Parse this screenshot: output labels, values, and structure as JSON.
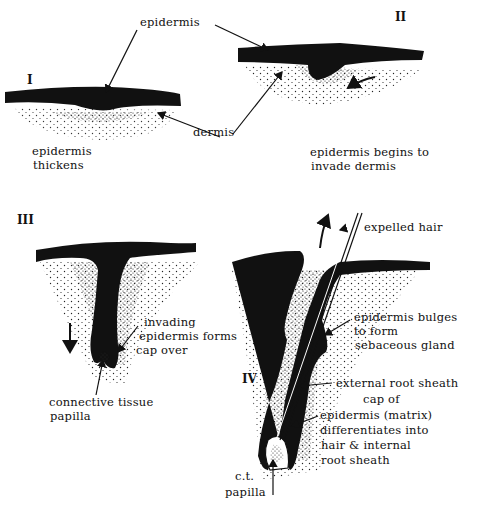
{
  "diagram": {
    "stages": [
      {
        "numeral": "I",
        "caption_line1": "epidermis",
        "caption_line2": "thickens"
      },
      {
        "numeral": "II",
        "caption_line1": "epidermis begins to",
        "caption_line2": "invade dermis"
      },
      {
        "numeral": "III",
        "caption_line1": "",
        "caption_line2": ""
      },
      {
        "numeral": "IV",
        "caption_line1": "",
        "caption_line2": ""
      }
    ],
    "labels": {
      "epidermis": "epidermis",
      "dermis": "dermis",
      "invading_1": "invading",
      "invading_2": "epidermis forms",
      "invading_3": "cap over",
      "ct_papilla_1": "connective  tissue",
      "ct_papilla_2": "papilla",
      "expelled_hair": "expelled hair",
      "sebaceous_1": "epidermis bulges",
      "sebaceous_2": "to form",
      "sebaceous_3": "sebaceous gland",
      "external_root_sheath": "external root sheath",
      "matrix_1": "cap  of",
      "matrix_2": "epidermis (matrix)",
      "matrix_3": "differentiates into",
      "matrix_4": "hair & internal",
      "matrix_5": "root sheath",
      "ct_1": "c.t.",
      "ct_2": "papilla"
    },
    "colors": {
      "ink": "#111111",
      "background": "#ffffff"
    }
  }
}
